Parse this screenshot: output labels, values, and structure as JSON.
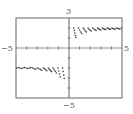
{
  "chart_data": {
    "type": "scatter",
    "title": "",
    "xlabel": "",
    "ylabel": "",
    "xlim": [
      -5,
      5
    ],
    "ylim": [
      -5,
      3
    ],
    "grid": false,
    "legend": null,
    "tick_labels": {
      "x_min": "−5",
      "x_max": "5",
      "y_max": "3",
      "y_min": "−5"
    },
    "x_ticks": [
      -4,
      -3,
      -2,
      -1,
      1,
      2,
      3,
      4
    ],
    "y_ticks": [
      -4,
      -3,
      -2,
      -1,
      1,
      2
    ],
    "series": [
      {
        "name": "right-branch",
        "points": [
          [
            0.45,
            2.0
          ],
          [
            0.5,
            1.75
          ],
          [
            0.55,
            1.5
          ],
          [
            0.6,
            1.25
          ],
          [
            0.65,
            1.05
          ],
          [
            0.9,
            2.0
          ],
          [
            1.0,
            1.8
          ],
          [
            1.1,
            1.6
          ],
          [
            1.2,
            1.45
          ],
          [
            1.35,
            2.0
          ],
          [
            1.45,
            1.85
          ],
          [
            1.55,
            1.7
          ],
          [
            1.65,
            1.6
          ],
          [
            1.8,
            2.0
          ],
          [
            1.9,
            1.88
          ],
          [
            2.0,
            1.78
          ],
          [
            2.1,
            1.7
          ],
          [
            2.25,
            2.0
          ],
          [
            2.35,
            1.9
          ],
          [
            2.45,
            1.82
          ],
          [
            2.55,
            1.76
          ],
          [
            2.7,
            2.0
          ],
          [
            2.8,
            1.92
          ],
          [
            2.9,
            1.85
          ],
          [
            3.0,
            1.8
          ],
          [
            3.15,
            2.0
          ],
          [
            3.25,
            1.93
          ],
          [
            3.35,
            1.88
          ],
          [
            3.45,
            1.84
          ],
          [
            3.6,
            2.0
          ],
          [
            3.7,
            1.94
          ],
          [
            3.8,
            1.9
          ],
          [
            3.9,
            1.86
          ],
          [
            4.05,
            2.0
          ],
          [
            4.15,
            1.95
          ],
          [
            4.25,
            1.91
          ],
          [
            4.35,
            1.88
          ],
          [
            4.5,
            2.0
          ],
          [
            4.6,
            1.95
          ],
          [
            4.7,
            1.92
          ],
          [
            4.8,
            1.9
          ],
          [
            4.95,
            2.0
          ]
        ]
      },
      {
        "name": "left-branch",
        "points": [
          [
            -4.95,
            -2.0
          ],
          [
            -4.8,
            -1.95
          ],
          [
            -4.65,
            -2.0
          ],
          [
            -4.5,
            -2.05
          ],
          [
            -4.35,
            -2.0
          ],
          [
            -4.2,
            -1.95
          ],
          [
            -4.05,
            -2.0
          ],
          [
            -3.9,
            -2.05
          ],
          [
            -3.75,
            -2.0
          ],
          [
            -3.6,
            -1.96
          ],
          [
            -3.45,
            -2.0
          ],
          [
            -3.3,
            -2.06
          ],
          [
            -3.15,
            -2.12
          ],
          [
            -3.0,
            -2.0
          ],
          [
            -2.85,
            -2.06
          ],
          [
            -2.7,
            -2.14
          ],
          [
            -2.55,
            -2.22
          ],
          [
            -2.4,
            -2.0
          ],
          [
            -2.3,
            -2.08
          ],
          [
            -2.2,
            -2.18
          ],
          [
            -2.1,
            -2.28
          ],
          [
            -1.95,
            -2.0
          ],
          [
            -1.85,
            -2.12
          ],
          [
            -1.75,
            -2.24
          ],
          [
            -1.65,
            -2.36
          ],
          [
            -1.5,
            -2.0
          ],
          [
            -1.4,
            -2.16
          ],
          [
            -1.3,
            -2.32
          ],
          [
            -1.2,
            -2.5
          ],
          [
            -1.05,
            -2.0
          ],
          [
            -0.97,
            -2.3
          ],
          [
            -0.9,
            -2.6
          ],
          [
            -0.83,
            -2.9
          ],
          [
            -0.6,
            -2.0
          ],
          [
            -0.55,
            -2.35
          ],
          [
            -0.5,
            -2.7
          ],
          [
            -0.45,
            -3.05
          ]
        ]
      }
    ]
  }
}
